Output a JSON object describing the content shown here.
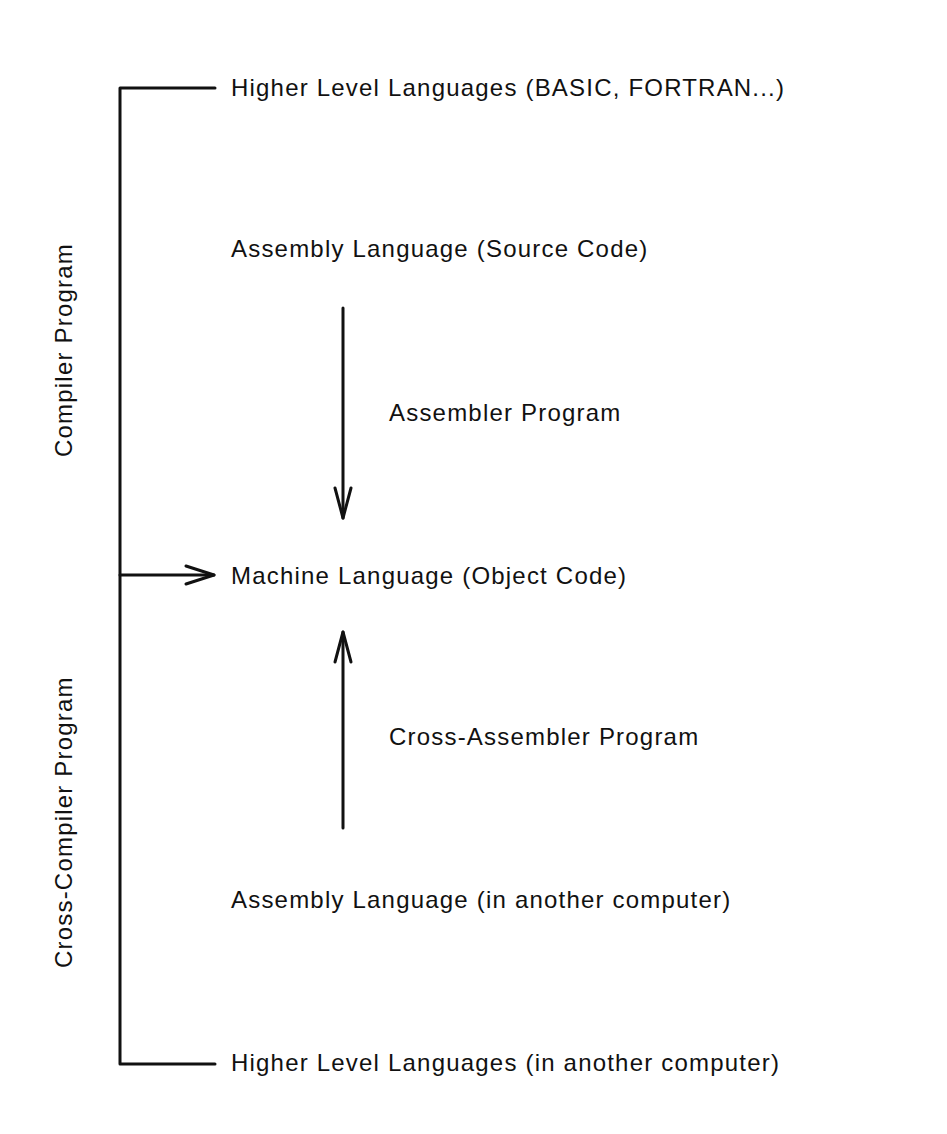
{
  "diagram": {
    "nodes": {
      "hll_top": "Higher Level Languages (BASIC, FORTRAN...)",
      "assembly_source": "Assembly Language (Source Code)",
      "machine": "Machine Language (Object Code)",
      "assembly_other": "Assembly Language (in another computer)",
      "hll_bottom": "Higher Level Languages (in another computer)"
    },
    "edges": {
      "assembler": "Assembler Program",
      "cross_assembler": "Cross-Assembler Program",
      "compiler": "Compiler Program",
      "cross_compiler": "Cross-Compiler Program"
    },
    "colors": {
      "ink": "#111111",
      "background": "#ffffff"
    }
  }
}
